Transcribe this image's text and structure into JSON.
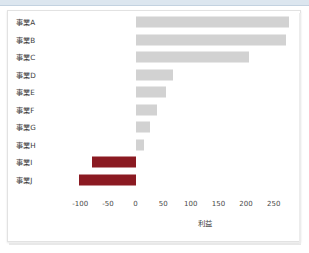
{
  "chart_data": {
    "type": "bar",
    "orientation": "horizontal",
    "title": "",
    "xlabel": "利益",
    "ylabel": "",
    "categories": [
      "事業A",
      "事業B",
      "事業C",
      "事業D",
      "事業E",
      "事業F",
      "事業G",
      "事業H",
      "事業I",
      "事業J"
    ],
    "values": [
      277,
      272,
      206,
      67,
      55,
      39,
      26,
      15,
      -79,
      -103
    ],
    "xlim": [
      -115,
      285
    ],
    "xticks": [
      -100,
      -50,
      0,
      50,
      100,
      150,
      200,
      250
    ],
    "xtick_labels": [
      "-100",
      "-50",
      "0",
      "50",
      "100",
      "150",
      "200",
      "250"
    ],
    "grid": false,
    "legend": null,
    "colors": {
      "positive_bar": "#d2d2d2",
      "negative_bar": "#8b1a22",
      "tick_text": "#4a4a4a",
      "label_text": "#3b3b3b",
      "card_background": "#ffffff",
      "card_border": "#e2e2e2",
      "top_strip": "#dce6ef"
    }
  }
}
